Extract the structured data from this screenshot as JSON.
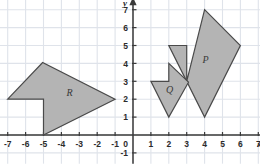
{
  "chart_data": {
    "type": "scatter",
    "title": "",
    "xlabel": "x",
    "ylabel": "y",
    "xlim": [
      -7.6,
      7.8
    ],
    "ylim": [
      -1.6,
      7.7
    ],
    "grid": true,
    "legend": "none",
    "origin_label": "0",
    "x_ticks": [
      -7,
      -6,
      -5,
      -4,
      -3,
      -2,
      -1,
      1,
      2,
      3,
      4,
      5,
      6,
      7
    ],
    "y_ticks": [
      -1,
      1,
      2,
      3,
      4,
      5,
      6,
      7
    ],
    "x_tick_labels": [
      "-7",
      "-6",
      "-5",
      "-4",
      "-3",
      "-2",
      "-1",
      "1",
      "2",
      "3",
      "4",
      "5",
      "6",
      "7"
    ],
    "y_tick_labels": [
      "-1",
      "1",
      "2",
      "3",
      "4",
      "5",
      "6",
      "7"
    ],
    "shapes": [
      {
        "name": "P",
        "label": "P",
        "label_x": 4.05,
        "label_y": 4.05,
        "fill": "#b4b4b4",
        "stroke": "#4a4a4a",
        "vertices": [
          [
            2.0,
            5.0
          ],
          [
            3.0,
            5.0
          ],
          [
            3.0,
            3.0
          ],
          [
            4.0,
            7.0
          ],
          [
            6.0,
            5.0
          ],
          [
            4.0,
            1.0
          ]
        ]
      },
      {
        "name": "Q",
        "label": "Q",
        "label_x": 2.05,
        "label_y": 2.35,
        "fill": "#b4b4b4",
        "stroke": "#4a4a4a",
        "vertices": [
          [
            1.0,
            3.0
          ],
          [
            2.0,
            3.0
          ],
          [
            2.0,
            4.0
          ],
          [
            3.1,
            2.95
          ],
          [
            2.0,
            1.0
          ]
        ]
      },
      {
        "name": "R",
        "label": "R",
        "label_x": -3.55,
        "label_y": 2.2,
        "fill": "#b4b4b4",
        "stroke": "#4a4a4a",
        "vertices": [
          [
            -7.0,
            2.0
          ],
          [
            -5.0,
            2.0
          ],
          [
            -5.0,
            0.0
          ],
          [
            -1.0,
            2.0
          ],
          [
            -5.05,
            4.05
          ]
        ]
      }
    ],
    "colors": {
      "grid": "#dfe3ea",
      "axis": "#3a3a3a",
      "shape_fill": "#b4b4b4",
      "shape_stroke": "#4a4a4a",
      "background": "#ffffff"
    }
  }
}
